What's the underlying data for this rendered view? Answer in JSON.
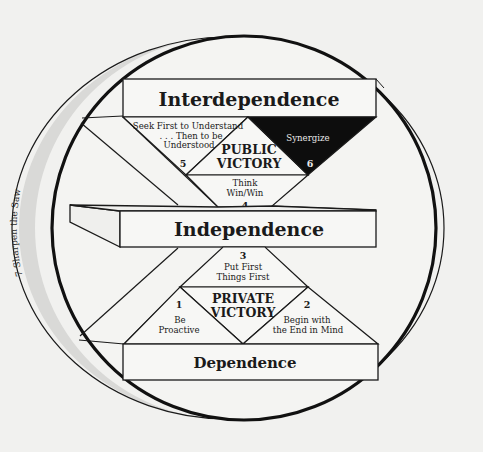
{
  "diagram": {
    "levels": {
      "top": "Interdependence",
      "middle": "Independence",
      "bottom": "Dependence"
    },
    "victories": {
      "public": [
        "PUBLIC",
        "VICTORY"
      ],
      "private": [
        "PRIVATE",
        "VICTORY"
      ]
    },
    "habits": [
      {
        "number": "1",
        "lines": [
          "Be",
          "Proactive"
        ]
      },
      {
        "number": "2",
        "lines": [
          "Begin with",
          "the End in Mind"
        ]
      },
      {
        "number": "3",
        "lines": [
          "Put First",
          "Things First"
        ]
      },
      {
        "number": "4",
        "lines": [
          "Think",
          "Win/Win"
        ]
      },
      {
        "number": "5",
        "lines": [
          "Seek First to Understand",
          ". . . Then to be",
          "Understood"
        ]
      },
      {
        "number": "6",
        "lines": [
          "Synergize"
        ]
      },
      {
        "number": "7",
        "label": "Sharpen the Saw",
        "arc_text": "7  Sharpen the Saw"
      }
    ],
    "colors": {
      "background": "#f1f1ef",
      "ink": "#1a1a1a",
      "band_shade": "#d9d9d7",
      "box_fill": "#f7f7f5",
      "synergize_fill": "#0d0d0d"
    }
  }
}
